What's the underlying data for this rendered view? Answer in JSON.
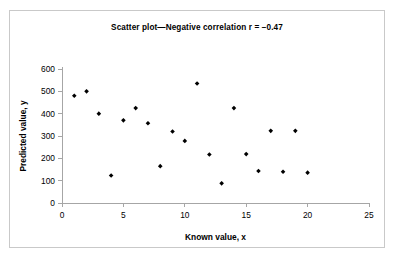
{
  "figure": {
    "border_color": "#c9c9c9",
    "background": "#ffffff",
    "axis_color": "#a6a6a6",
    "marker_color": "#000000"
  },
  "chart_data": {
    "type": "scatter",
    "title": "Scatter plot—Negative correlation r = −0.47",
    "xlabel": "Known value, x",
    "ylabel": "Predicted value, y",
    "xlim": [
      0,
      25
    ],
    "ylim": [
      0,
      600
    ],
    "xticks": [
      0,
      5,
      10,
      15,
      20,
      25
    ],
    "yticks": [
      0,
      100,
      200,
      300,
      400,
      500,
      600
    ],
    "xtick_labels": [
      "0",
      "5",
      "10",
      "15",
      "20",
      "25"
    ],
    "ytick_labels": [
      "0",
      "100",
      "200",
      "300",
      "400",
      "500",
      "600"
    ],
    "grid": false,
    "legend": false,
    "correlation_r": -0.47,
    "marker": "diamond",
    "x": [
      1,
      2,
      3,
      4,
      5,
      6,
      7,
      8,
      9,
      10,
      11,
      12,
      13,
      14,
      15,
      16,
      17,
      18,
      19,
      20
    ],
    "y": [
      480,
      500,
      400,
      123,
      370,
      425,
      357,
      165,
      320,
      278,
      535,
      217,
      88,
      425,
      219,
      143,
      323,
      140,
      323,
      136
    ],
    "points": [
      {
        "x": 1,
        "y": 480
      },
      {
        "x": 2,
        "y": 500
      },
      {
        "x": 3,
        "y": 400
      },
      {
        "x": 4,
        "y": 123
      },
      {
        "x": 5,
        "y": 370
      },
      {
        "x": 6,
        "y": 425
      },
      {
        "x": 7,
        "y": 357
      },
      {
        "x": 8,
        "y": 165
      },
      {
        "x": 9,
        "y": 320
      },
      {
        "x": 10,
        "y": 278
      },
      {
        "x": 11,
        "y": 535
      },
      {
        "x": 12,
        "y": 217
      },
      {
        "x": 13,
        "y": 88
      },
      {
        "x": 14,
        "y": 425
      },
      {
        "x": 15,
        "y": 219
      },
      {
        "x": 16,
        "y": 143
      },
      {
        "x": 17,
        "y": 323
      },
      {
        "x": 18,
        "y": 140
      },
      {
        "x": 19,
        "y": 323
      },
      {
        "x": 20,
        "y": 136
      }
    ]
  }
}
